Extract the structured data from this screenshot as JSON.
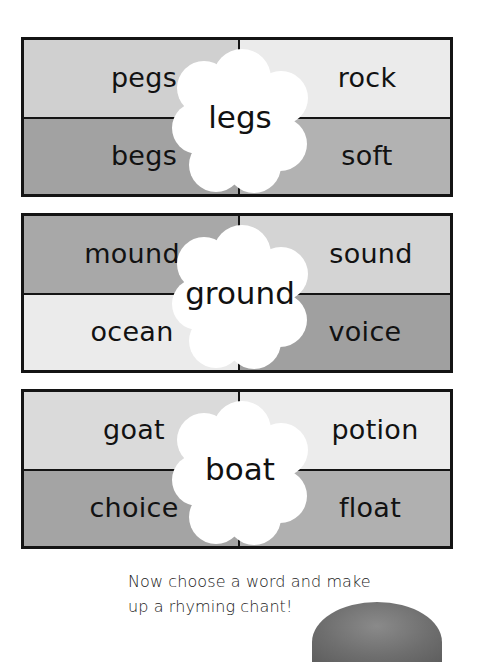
{
  "worksheet": {
    "boxes": [
      {
        "center_word": "legs",
        "cells": {
          "top_left": {
            "word": "pegs",
            "color": "#d0d0d0"
          },
          "top_right": {
            "word": "rock",
            "color": "#ebebeb"
          },
          "bottom_left": {
            "word": "begs",
            "color": "#a2a2a2"
          },
          "bottom_right": {
            "word": "soft",
            "color": "#b2b2b2"
          }
        }
      },
      {
        "center_word": "ground",
        "cells": {
          "top_left": {
            "word": "mound",
            "color": "#a8a8a8"
          },
          "top_right": {
            "word": "sound",
            "color": "#d4d4d4"
          },
          "bottom_left": {
            "word": "ocean",
            "color": "#ebebeb"
          },
          "bottom_right": {
            "word": "voice",
            "color": "#a0a0a0"
          }
        }
      },
      {
        "center_word": "boat",
        "cells": {
          "top_left": {
            "word": "goat",
            "color": "#dadada"
          },
          "top_right": {
            "word": "potion",
            "color": "#ececec"
          },
          "bottom_left": {
            "word": "choice",
            "color": "#a4a4a4"
          },
          "bottom_right": {
            "word": "float",
            "color": "#b0b0b0"
          }
        }
      }
    ],
    "instruction": {
      "line1": "Now choose a word and make",
      "line2": "up a rhyming chant!"
    },
    "decoration": {
      "icon": "rock-icon"
    }
  }
}
